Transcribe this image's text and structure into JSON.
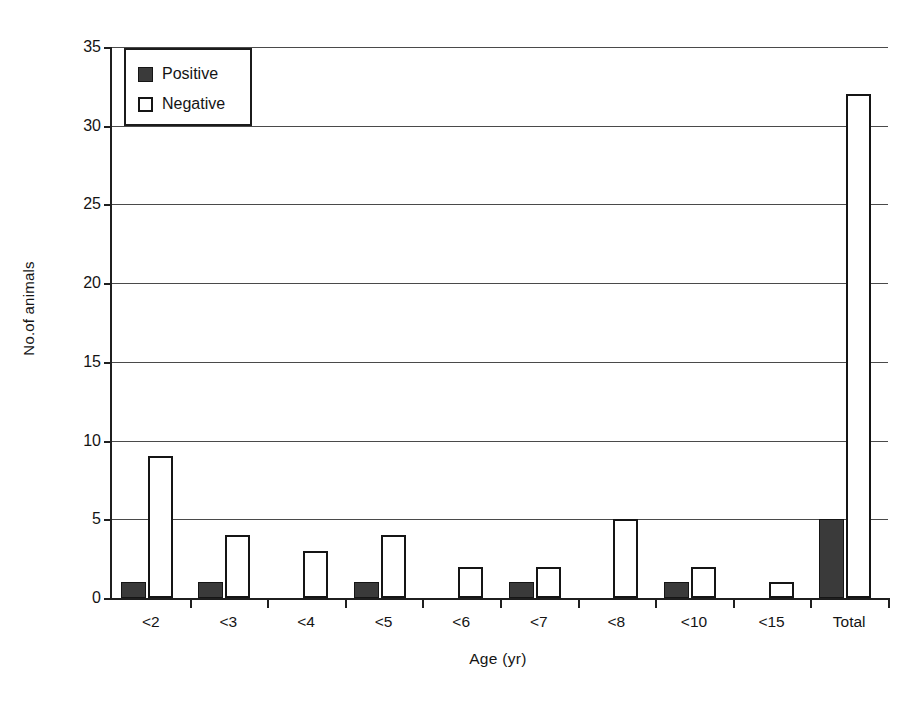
{
  "chart_data": {
    "type": "bar",
    "title": "",
    "xlabel": "Age (yr)",
    "ylabel": "No.of animals",
    "categories": [
      "<2",
      "<3",
      "<4",
      "<5",
      "<6",
      "<7",
      "<8",
      "<10",
      "<15",
      "Total"
    ],
    "series": [
      {
        "name": "Positive",
        "color": "#3a3a3a",
        "values": [
          1,
          1,
          0,
          1,
          0,
          1,
          0,
          1,
          0,
          5
        ]
      },
      {
        "name": "Negative",
        "color": "#ffffff",
        "values": [
          9,
          4,
          3,
          4,
          2,
          2,
          5,
          2,
          1,
          32
        ]
      }
    ],
    "ylim": [
      0,
      35
    ],
    "ytick_values": [
      0,
      5,
      10,
      15,
      20,
      25,
      30,
      35
    ],
    "ytick_labels": [
      "0",
      "5",
      "10",
      "15",
      "20",
      "25",
      "30",
      "35"
    ],
    "grid": "horizontal",
    "legend_position": "top-left-inside",
    "legend_entries": [
      {
        "label": "Positive",
        "swatch": "filled-dark-square"
      },
      {
        "label": "Negative",
        "swatch": "open-white-square"
      }
    ]
  }
}
